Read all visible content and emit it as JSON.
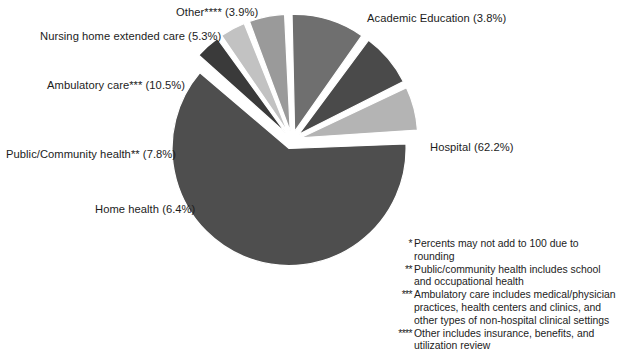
{
  "chart_data": {
    "type": "pie",
    "title": "",
    "subtitle": "",
    "xlabel": "",
    "ylabel": "",
    "legend_position": "none",
    "grid": false,
    "unit": "%",
    "total": 99.9,
    "categories": [
      "Hospital",
      "Academic Education",
      "Other****",
      "Nursing home extended care",
      "Ambulatory care***",
      "Public/Community health**",
      "Home health"
    ],
    "values": [
      62.2,
      3.8,
      3.9,
      5.3,
      10.5,
      7.8,
      6.4
    ],
    "slices": [
      {
        "key": "hospital",
        "name": "Hospital",
        "value": 62.2,
        "label": "Hospital (62.2%)",
        "color": "#4e4e4e",
        "exploded": true
      },
      {
        "key": "academic-education",
        "name": "Academic Education",
        "value": 3.8,
        "label": "Academic Education (3.8%)",
        "color": "#3a3a3a",
        "exploded": true
      },
      {
        "key": "other",
        "name": "Other****",
        "value": 3.9,
        "label": "Other**** (3.9%)",
        "color": "#c2c2c2",
        "exploded": true
      },
      {
        "key": "nursing-home-extended-care",
        "name": "Nursing home extended care",
        "value": 5.3,
        "label": "Nursing home extended care (5.3%)",
        "color": "#9a9a9a",
        "exploded": true
      },
      {
        "key": "ambulatory-care",
        "name": "Ambulatory care***",
        "value": 10.5,
        "label": "Ambulatory care*** (10.5%)",
        "color": "#6f6f6f",
        "exploded": true
      },
      {
        "key": "public-community-health",
        "name": "Public/Community health**",
        "value": 7.8,
        "label": "Public/Community health** (7.8%)",
        "color": "#4a4a4a",
        "exploded": true
      },
      {
        "key": "home-health",
        "name": "Home health",
        "value": 6.4,
        "label": "Home health (6.4%)",
        "color": "#b4b4b4",
        "exploded": true
      }
    ]
  },
  "labels": {
    "academic_education": "Academic Education (3.8%)",
    "hospital": "Hospital (62.2%)",
    "other": "Other**** (3.9%)",
    "nursing_home": "Nursing home extended care (5.3%)",
    "ambulatory_care": "Ambulatory care*** (10.5%)",
    "public_community_health": "Public/Community health** (7.8%)",
    "home_health": "Home health (6.4%)"
  },
  "footnotes": [
    {
      "marker": "*",
      "text": "Percents may not add to 100 due to rounding"
    },
    {
      "marker": "**",
      "text": "Public/community health includes school and occupational health"
    },
    {
      "marker": "***",
      "text": "Ambulatory care includes medical/physician practices, health centers and clinics, and other types of non-hospital clinical settings"
    },
    {
      "marker": "****",
      "text": "Other includes insurance, benefits, and utilization review"
    }
  ],
  "colors": {
    "background": "#ffffff",
    "text": "#1c1c1c",
    "slice_gap": "#ffffff"
  }
}
